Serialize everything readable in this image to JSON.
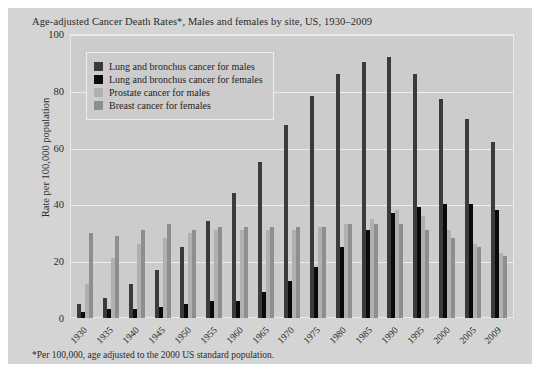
{
  "title": "Age-adjusted Cancer Death Rates*, Males and females by site, US, 1930–2009",
  "footnote": "*Per 100,000, age adjusted to the 2000 US standard population.",
  "legend": {
    "items": [
      {
        "label": "Lung and bronchus cancer for males",
        "color": "#3b3b3b"
      },
      {
        "label": "Lung and bronchus cancer for females",
        "color": "#0a0a0a"
      },
      {
        "label": "Prostate cancer for males",
        "color": "#b0b0b0"
      },
      {
        "label": "Breast cancer for females",
        "color": "#8e8e8e"
      }
    ]
  },
  "chart_data": {
    "type": "bar",
    "title": "Age-adjusted Cancer Death Rates*, Males and females by site, US, 1930–2009",
    "xlabel": "",
    "ylabel": "Rate per 100,000 population",
    "ylim": [
      0,
      100
    ],
    "yticks": [
      0,
      20,
      40,
      60,
      80,
      100
    ],
    "grid": true,
    "legend_position": "top-left",
    "categories": [
      "1930",
      "1935",
      "1940",
      "1945",
      "1950",
      "1955",
      "1960",
      "1965",
      "1970",
      "1975",
      "1980",
      "1985",
      "1990",
      "1995",
      "2000",
      "2005",
      "2009"
    ],
    "series": [
      {
        "name": "Lung and bronchus cancer for males",
        "color": "#3b3b3b",
        "values": [
          5,
          7,
          12,
          17,
          25,
          34,
          44,
          55,
          68,
          78,
          86,
          90,
          92,
          86,
          77,
          70,
          62
        ]
      },
      {
        "name": "Lung and bronchus cancer for females",
        "color": "#0a0a0a",
        "values": [
          2,
          3,
          3,
          4,
          5,
          6,
          6,
          9,
          13,
          18,
          25,
          31,
          37,
          39,
          40,
          40,
          38
        ]
      },
      {
        "name": "Prostate cancer for males",
        "color": "#b0b0b0",
        "values": [
          12,
          21,
          26,
          28,
          30,
          31,
          31,
          31,
          31,
          32,
          33,
          35,
          38,
          36,
          31,
          26,
          23
        ]
      },
      {
        "name": "Breast cancer for females",
        "color": "#8e8e8e",
        "values": [
          30,
          29,
          31,
          33,
          31,
          32,
          32,
          32,
          32,
          32,
          33,
          33,
          33,
          31,
          28,
          25,
          22
        ]
      }
    ]
  }
}
